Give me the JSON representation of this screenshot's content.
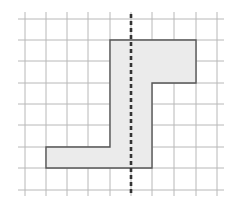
{
  "diagram": {
    "type": "grid-reflection",
    "grid": {
      "x_lines": [
        25,
        46,
        67,
        88,
        110,
        131,
        152,
        174,
        196,
        217
      ],
      "y_lines": [
        19,
        40,
        61,
        83,
        104,
        125,
        147,
        168,
        190
      ],
      "x_extent": [
        18,
        224
      ],
      "y_extent": [
        12,
        196
      ],
      "line_color": "#b8b8b8"
    },
    "shape": {
      "points": "110,40 196,40 196,83 152,83 152,168 46,168 46,147 110,147",
      "fill": "#ebebeb",
      "stroke": "#555555"
    },
    "mirror_line": {
      "x": 131,
      "y1": 14,
      "y2": 196,
      "color": "#333333",
      "dash": "4,3"
    }
  }
}
